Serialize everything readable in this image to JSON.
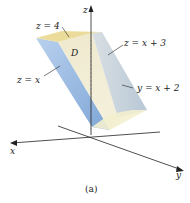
{
  "figure": {
    "caption": "(a)",
    "labels": {
      "top_plane": "z = 4",
      "region": "D",
      "left_plane": "z = x",
      "right_plane": "z = x + 3",
      "side_plane": "y = x + 2"
    },
    "axes": {
      "x": "x",
      "y": "y",
      "z": "z"
    },
    "colors": {
      "top_face": "#efe2a8",
      "left_face": "#9dbde3",
      "front_face": "#ece8d2",
      "right_face": "#c9d6e0",
      "axis": "#222222"
    }
  }
}
